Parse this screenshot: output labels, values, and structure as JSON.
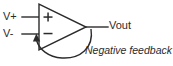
{
  "diagram": {
    "type": "operational-amplifier-schematic",
    "colors": {
      "line": "#2b2b2b",
      "background": "#ffffff"
    },
    "labels": {
      "non_inverting_input": "V+",
      "inverting_input": "V-",
      "output": "Vout",
      "feedback": "Negative feedback"
    },
    "symbols": {
      "plus": "+",
      "minus": "−"
    },
    "icons": {
      "amplifier": "triangle-amplifier-icon",
      "feedback_arrow": "arrow-up-icon"
    }
  }
}
